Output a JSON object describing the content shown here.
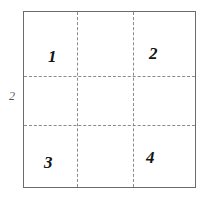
{
  "figure": {
    "type": "partitioned-square-diagram",
    "background_color": "#ffffff",
    "side_label": "2",
    "border": {
      "style": "solid",
      "color": "#6b6b6b",
      "width_px": 1
    },
    "dashed_lines": {
      "style": "dashed",
      "color": "#8a8a8a",
      "horizontal_count": 2,
      "vertical_count": 2
    },
    "cells": [
      {
        "label": "1",
        "position": "top-left"
      },
      {
        "label": "2",
        "position": "top-right"
      },
      {
        "label": "3",
        "position": "bottom-left"
      },
      {
        "label": "4",
        "position": "bottom-right"
      }
    ]
  }
}
